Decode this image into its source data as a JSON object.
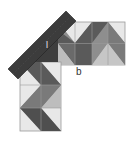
{
  "diagram": {
    "title": "",
    "labels": {
      "l": "l",
      "b": "b"
    },
    "colors": {
      "background": "#ffffff",
      "light": "#e8e8e8",
      "mid_light": "#bdbdbd",
      "mid": "#8e8e8e",
      "dark": "#5a5a5a",
      "ruler": "#3c3c3c",
      "grid_line": "#9a9a9a"
    },
    "horizontal_strip": {
      "x": 58,
      "y": 22,
      "cols": 4,
      "rows": 2,
      "cell_w": 16.75,
      "cell_h": 21.5
    },
    "vertical_strip": {
      "x": 20,
      "y": 62,
      "cols": 2,
      "rows": 3,
      "cell_w": 20.5,
      "cell_h": 23
    },
    "ruler": {
      "x1": 10,
      "y1": 73,
      "x2": 72,
      "y2": 14,
      "width": 12
    }
  }
}
